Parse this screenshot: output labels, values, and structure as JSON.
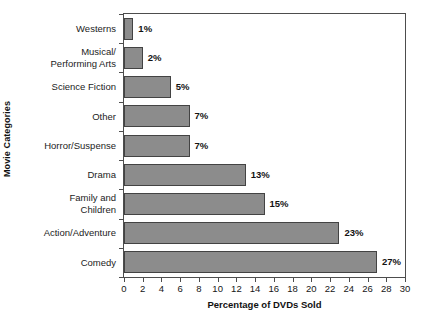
{
  "chart_data": {
    "type": "bar",
    "orientation": "horizontal",
    "title": "",
    "xlabel": "Percentage of DVDs Sold",
    "ylabel": "Movie Categories",
    "categories": [
      "Westerns",
      "Musical/ Performing Arts",
      "Science Fiction",
      "Other",
      "Horror/Suspense",
      "Drama",
      "Family and Children",
      "Action/Adventure",
      "Comedy"
    ],
    "category_lines": [
      [
        "Westerns"
      ],
      [
        "Musical/",
        "Performing Arts"
      ],
      [
        "Science Fiction"
      ],
      [
        "Other"
      ],
      [
        "Horror/Suspense"
      ],
      [
        "Drama"
      ],
      [
        "Family and",
        "Children"
      ],
      [
        "Action/Adventure"
      ],
      [
        "Comedy"
      ]
    ],
    "values": [
      1,
      2,
      5,
      7,
      7,
      13,
      15,
      23,
      27
    ],
    "value_labels": [
      "1%",
      "2%",
      "5%",
      "7%",
      "7%",
      "13%",
      "15%",
      "23%",
      "27%"
    ],
    "xlim": [
      0,
      30
    ],
    "xticks": [
      0,
      2,
      4,
      6,
      8,
      10,
      12,
      14,
      16,
      18,
      20,
      22,
      24,
      26,
      28,
      30
    ],
    "xtick_labels": [
      "0",
      "2",
      "4",
      "6",
      "8",
      "10",
      "12",
      "14",
      "16",
      "18",
      "20",
      "22",
      "24",
      "26",
      "28",
      "30"
    ],
    "grid": false,
    "legend": null,
    "bar_color": "#8c8c8c",
    "bar_border_color": "#434343",
    "axis_color": "#4d4d4d",
    "text_color": "#131313",
    "background": "#ffffff"
  }
}
